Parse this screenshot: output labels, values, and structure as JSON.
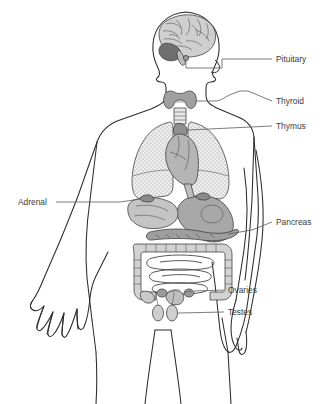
{
  "figure": {
    "background_color": "#ffffff",
    "outline_color": "#2b2b2b",
    "label_color": "#3b3b3b",
    "leader_color": "#5a5a5a",
    "organ_fill_gray": "#a8a8a8",
    "organ_fill_light": "#d6d6d6",
    "lung_fill": "#e3e3e3",
    "brain_fill": "#cfcfcf",
    "cerebellum_fill": "#6f6f6f"
  },
  "labels": [
    {
      "id": "pituitary",
      "text": "Pituitary",
      "side": "right",
      "text_x": 276,
      "text_y": 62,
      "leader": "M 262 59 L 272 59"
    },
    {
      "id": "thyroid",
      "text": "Thyroid",
      "side": "right",
      "text_x": 276,
      "text_y": 104,
      "leader": "M 262 101 L 272 101"
    },
    {
      "id": "thymus",
      "text": "Thymus",
      "side": "right",
      "text_x": 276,
      "text_y": 129,
      "leader": "M 262 126 L 272 126"
    },
    {
      "id": "pancreas",
      "text": "Pancreas",
      "side": "right",
      "text_x": 276,
      "text_y": 225,
      "leader": "M 262 222 L 272 222"
    },
    {
      "id": "ovaries",
      "text": "Ovaries",
      "side": "right",
      "text_x": 228,
      "text_y": 293,
      "leader": "M 214 290 L 224 290"
    },
    {
      "id": "testes",
      "text": "Testes",
      "side": "right",
      "text_x": 228,
      "text_y": 315,
      "leader": "M 214 312 L 224 312"
    },
    {
      "id": "adrenal",
      "text": "Adrenal",
      "side": "left",
      "text_x": 18,
      "text_y": 205,
      "leader": "M 58 202 L 120 202"
    }
  ],
  "organs": [
    {
      "id": "brain",
      "name": "Brain"
    },
    {
      "id": "cerebellum",
      "name": "Cerebellum"
    },
    {
      "id": "pituitary-gland",
      "name": "Pituitary gland"
    },
    {
      "id": "thyroid-gland",
      "name": "Thyroid gland"
    },
    {
      "id": "trachea",
      "name": "Trachea"
    },
    {
      "id": "thymus-gland",
      "name": "Thymus gland"
    },
    {
      "id": "lung-left",
      "name": "Left lung"
    },
    {
      "id": "lung-right",
      "name": "Right lung"
    },
    {
      "id": "heart",
      "name": "Heart"
    },
    {
      "id": "stomach",
      "name": "Stomach"
    },
    {
      "id": "liver",
      "name": "Liver"
    },
    {
      "id": "pancreas-gland",
      "name": "Pancreas"
    },
    {
      "id": "adrenal-glands",
      "name": "Adrenal glands"
    },
    {
      "id": "large-intestine",
      "name": "Large intestine"
    },
    {
      "id": "small-intestine",
      "name": "Small intestine"
    },
    {
      "id": "ovaries-organ",
      "name": "Ovaries"
    },
    {
      "id": "testes-organ",
      "name": "Testes"
    }
  ]
}
